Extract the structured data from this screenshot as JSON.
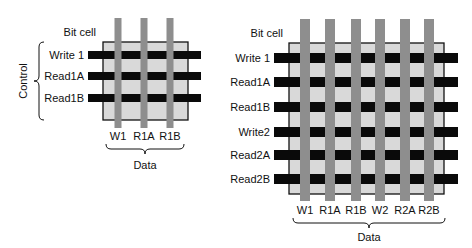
{
  "colors": {
    "cell_fill": "#d9d9d9",
    "cell_border": "#111111",
    "control_line": "#0a0a0a",
    "data_line": "#8e8e8e",
    "text": "#111111"
  },
  "diagrams": [
    {
      "name": "single-port-cell",
      "title": "Bit cell",
      "group_labels": {
        "control": "Control",
        "data": "Data"
      },
      "cell": {
        "x": 103,
        "y": 42,
        "w": 85,
        "h": 78
      },
      "control_lines": [
        {
          "label": "Write 1",
          "y": 55
        },
        {
          "label": "Read1A",
          "y": 76
        },
        {
          "label": "Read1B",
          "y": 98
        }
      ],
      "control_extent": {
        "x1": 88,
        "x2": 201,
        "thickness": 8
      },
      "data_lines": [
        {
          "label": "W1",
          "x": 118
        },
        {
          "label": "R1A",
          "x": 144
        },
        {
          "label": "R1B",
          "x": 170
        }
      ],
      "data_extent": {
        "y1": 18,
        "y2": 128,
        "thickness": 7
      },
      "title_pos": {
        "x": 96,
        "y": 36
      },
      "data_label_y": 140,
      "data_brace": {
        "x1": 106,
        "x2": 184,
        "y": 144
      },
      "data_title_pos": {
        "x": 145,
        "y": 169
      },
      "control_brace": {
        "x": 44,
        "y1": 42,
        "y2": 120
      },
      "control_title_pos": {
        "x": 27,
        "y": 81
      }
    },
    {
      "name": "dual-port-cell",
      "title": "Bit cell",
      "group_labels": {
        "data": "Data"
      },
      "cell": {
        "x": 289,
        "y": 43,
        "w": 155,
        "h": 151
      },
      "control_lines": [
        {
          "label": "Write 1",
          "y": 58
        },
        {
          "label": "Read1A",
          "y": 82
        },
        {
          "label": "Read1B",
          "y": 107
        },
        {
          "label": "Write2",
          "y": 132
        },
        {
          "label": "Read2A",
          "y": 155
        },
        {
          "label": "Read2B",
          "y": 179
        }
      ],
      "control_extent": {
        "x1": 274,
        "x2": 458,
        "thickness": 10
      },
      "data_lines": [
        {
          "label": "W1",
          "x": 305
        },
        {
          "label": "R1A",
          "x": 330
        },
        {
          "label": "R1B",
          "x": 356
        },
        {
          "label": "W2",
          "x": 380
        },
        {
          "label": "R2A",
          "x": 405
        },
        {
          "label": "R2B",
          "x": 429
        }
      ],
      "data_extent": {
        "y1": 19,
        "y2": 201,
        "thickness": 10
      },
      "title_pos": {
        "x": 283,
        "y": 37
      },
      "data_label_y": 214,
      "data_brace": {
        "x1": 293,
        "x2": 445,
        "y": 218
      },
      "data_title_pos": {
        "x": 369,
        "y": 241
      }
    }
  ]
}
